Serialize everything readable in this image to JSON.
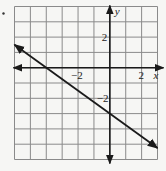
{
  "problem_marker": "•",
  "chart_data": {
    "type": "line",
    "title": "",
    "xlabel": "x",
    "ylabel": "y",
    "xlim": [
      -6,
      3
    ],
    "ylim": [
      -6,
      4
    ],
    "grid": true,
    "grid_step": 1,
    "tick_labels": {
      "x": [
        {
          "value": -2,
          "label": "−2"
        },
        {
          "value": 2,
          "label": "2"
        }
      ],
      "y": [
        {
          "value": 2,
          "label": "2"
        },
        {
          "value": -2,
          "label": "−2"
        }
      ]
    },
    "series": [
      {
        "name": "line",
        "equation": "y = -3/4 x - 3",
        "slope": -0.75,
        "intercept": -3,
        "x": [
          -6,
          -4,
          0,
          3
        ],
        "y": [
          1.5,
          0,
          -3,
          -5.25
        ],
        "arrows": "both"
      }
    ],
    "colors": {
      "grid": "#8a8a8a",
      "axis": "#1a1a1a",
      "line": "#1a1a1a"
    }
  }
}
